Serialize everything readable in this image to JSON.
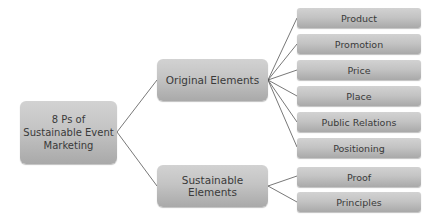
{
  "diagram": {
    "root": {
      "label": "8 Ps of Sustainable Event Marketing",
      "lines": [
        "8 Ps of",
        "Sustainable Event",
        "Marketing"
      ]
    },
    "branches": [
      {
        "label": "Original Elements",
        "children": [
          "Product",
          "Promotion",
          "Price",
          "Place",
          "Public Relations",
          "Positioning"
        ]
      },
      {
        "label": "Sustainable Elements",
        "children": [
          "Proof",
          "Principles"
        ]
      }
    ]
  },
  "colors": {
    "box_top": "#d2d2d2",
    "box_bottom": "#a9a9a9",
    "text": "#3a3a3a",
    "connector": "#555555",
    "background": "#ffffff"
  }
}
